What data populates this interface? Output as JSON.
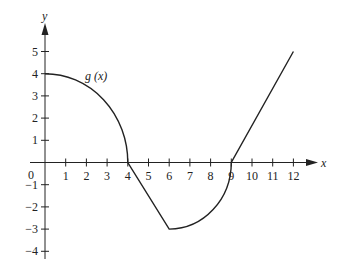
{
  "chart_data": {
    "type": "line",
    "title": "",
    "xlabel": "x",
    "ylabel": "y",
    "series_label": "g (x)",
    "xlim": [
      0,
      12
    ],
    "ylim": [
      -4,
      5
    ],
    "grid": false,
    "x_ticks": [
      1,
      2,
      3,
      4,
      5,
      6,
      7,
      8,
      9,
      10,
      11,
      12
    ],
    "y_ticks": [
      -4,
      -3,
      -2,
      -1,
      1,
      2,
      3,
      4,
      5
    ],
    "origin_label": "0",
    "segments": [
      {
        "kind": "quarter-circle arc (concave down)",
        "from": [
          0,
          4
        ],
        "to": [
          4,
          0
        ],
        "center": [
          0,
          0
        ],
        "radius": 4
      },
      {
        "kind": "line",
        "from": [
          4,
          0
        ],
        "to": [
          6,
          -3
        ]
      },
      {
        "kind": "quarter-circle arc (concave up)",
        "from": [
          6,
          -3
        ],
        "to": [
          9,
          0
        ],
        "center": [
          6,
          0
        ],
        "radius": 3
      },
      {
        "kind": "line",
        "from": [
          9,
          0
        ],
        "to": [
          12,
          5
        ]
      }
    ],
    "key_points": [
      [
        0,
        4
      ],
      [
        4,
        0
      ],
      [
        6,
        -3
      ],
      [
        9,
        0
      ],
      [
        12,
        5
      ]
    ],
    "line_color": "#222222"
  }
}
